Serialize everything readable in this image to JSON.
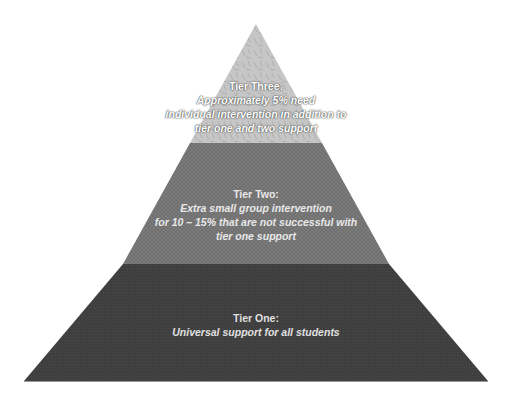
{
  "diagram": {
    "type": "pyramid",
    "colors": {
      "background": "#ffffff",
      "tier_three_fill": "#c4c4c4",
      "tier_two_fill": "#7a7a7a",
      "tier_one_fill": "#3d3d3d"
    },
    "tiers": [
      {
        "level": "top",
        "title": "Tier Three:",
        "description_lines": [
          "Approximately 5% need",
          "individual intervention in addition to",
          "tier one and two support"
        ]
      },
      {
        "level": "middle",
        "title": "Tier Two:",
        "description_lines": [
          "Extra small group intervention",
          "for 10 – 15% that are not successful with",
          "tier one support"
        ]
      },
      {
        "level": "bottom",
        "title": "Tier One:",
        "description_lines": [
          "Universal support for all students"
        ]
      }
    ]
  }
}
